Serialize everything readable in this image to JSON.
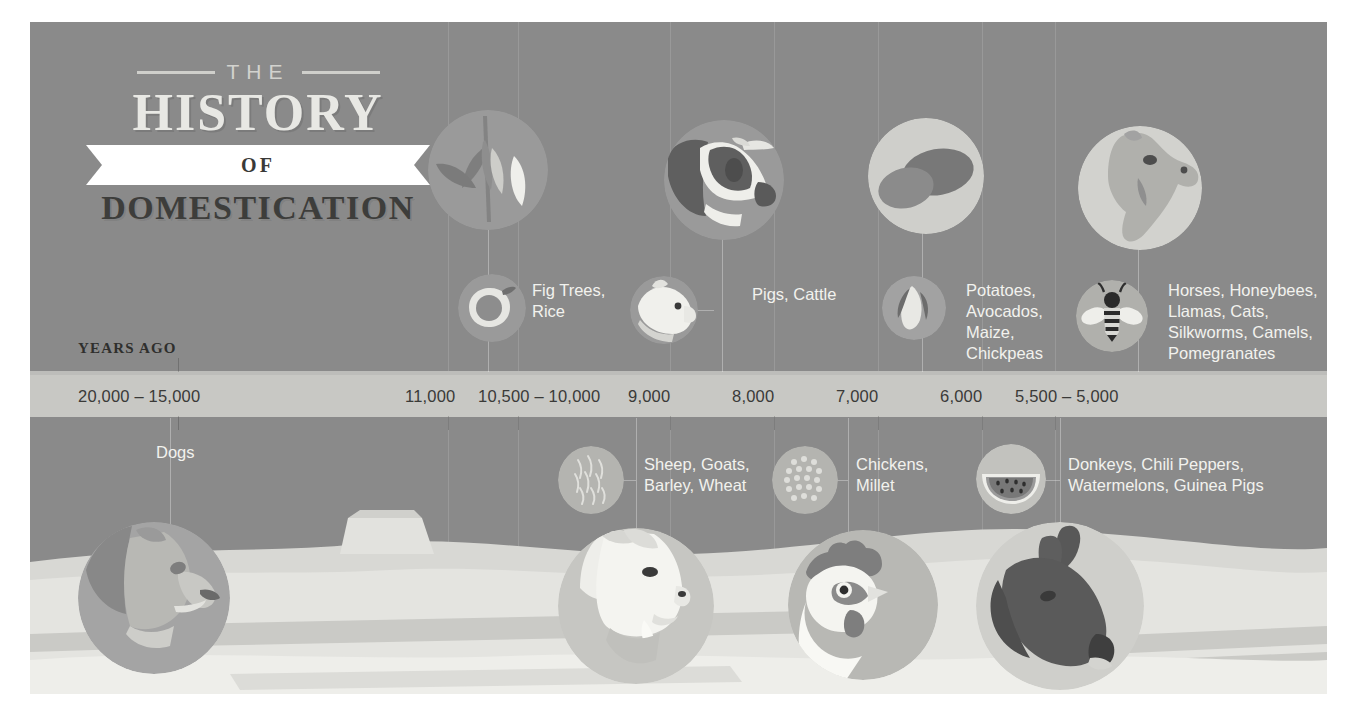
{
  "title": {
    "the": "THE",
    "history": "HISTORY",
    "of": "OF",
    "domestication": "DOMESTICATION"
  },
  "axis": {
    "caption": "YEARS AGO",
    "ticks": [
      {
        "label": "20,000 – 15,000",
        "x": 48
      },
      {
        "label": "11,000",
        "x": 418
      },
      {
        "label": "10,500 – 10,000",
        "x": 488
      },
      {
        "label": "9,000",
        "x": 640
      },
      {
        "label": "8,000",
        "x": 744
      },
      {
        "label": "7,000",
        "x": 848
      },
      {
        "label": "6,000",
        "x": 952
      },
      {
        "label": "5,500 – 5,000",
        "x": 1025
      }
    ]
  },
  "above_timeline": [
    {
      "name": "fig-rice",
      "label": "Fig Trees,\nRice"
    },
    {
      "name": "pigs-cattle",
      "label": "Pigs, Cattle"
    },
    {
      "name": "potatoes",
      "label": "Potatoes,\nAvocados,\nMaize,\nChickpeas"
    },
    {
      "name": "horses",
      "label": "Horses, Honeybees,\nLlamas, Cats,\nSilkworms, Camels,\nPomegranates"
    }
  ],
  "below_timeline": [
    {
      "name": "dogs",
      "label": "Dogs"
    },
    {
      "name": "sheep-goats",
      "label": "Sheep, Goats,\nBarley, Wheat"
    },
    {
      "name": "chickens",
      "label": "Chickens,\nMillet"
    },
    {
      "name": "donkeys",
      "label": "Donkeys, Chili Peppers,\nWatermelons, Guinea Pigs"
    }
  ],
  "icons": {
    "rice": "rice-plant-icon",
    "fig": "fig-fruit-icon",
    "cow": "cow-head-icon",
    "pig": "pig-head-icon",
    "potato": "potato-icon",
    "maize": "maize-cob-icon",
    "camel": "camel-head-icon",
    "bee": "honeybee-icon",
    "dog": "dog-head-icon",
    "goat": "goat-head-icon",
    "wheat": "wheat-ear-icon",
    "chicken": "rooster-head-icon",
    "millet": "millet-head-icon",
    "donkey": "donkey-head-icon",
    "watermelon": "watermelon-slice-icon"
  },
  "colors": {
    "background": "#8a8a8a",
    "band": "#c8c8c4",
    "page": "#ffffff",
    "label_text": "#f2f2ee",
    "axis_text": "#3a3a38"
  }
}
